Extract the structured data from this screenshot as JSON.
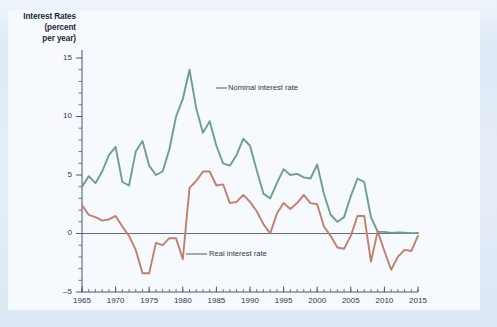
{
  "figure": {
    "background_color": "#e3ecf7",
    "panel_color": "#f6f9fd"
  },
  "axis_title": {
    "line1": "Interest Rates",
    "line2": "(percent",
    "line3": "per year)"
  },
  "annotations": {
    "nominal": "Nominal interest rate",
    "real": "Real interest rate"
  },
  "colors": {
    "nominal": "#6f9f88",
    "real": "#c0806a",
    "axis": "#4a5a68",
    "zero_line": "#6b6f75",
    "text": "#2b3a48"
  },
  "chart_data": {
    "type": "line",
    "title": "Interest Rates (percent per year)",
    "xlabel": "",
    "ylabel": "Interest Rates (percent per year)",
    "xlim": [
      1965,
      2015
    ],
    "ylim": [
      -5,
      15
    ],
    "yticks": [
      -5,
      0,
      5,
      10,
      15
    ],
    "xticks": [
      1965,
      1970,
      1975,
      1980,
      1985,
      1990,
      1995,
      2000,
      2005,
      2010,
      2015
    ],
    "minor_tick_step": 1,
    "grid": false,
    "legend_position": "inline-annotation",
    "zero_line": 0,
    "x": [
      1965,
      1966,
      1967,
      1968,
      1969,
      1970,
      1971,
      1972,
      1973,
      1974,
      1975,
      1976,
      1977,
      1978,
      1979,
      1980,
      1981,
      1982,
      1983,
      1984,
      1985,
      1986,
      1987,
      1988,
      1989,
      1990,
      1991,
      1992,
      1993,
      1994,
      1995,
      1996,
      1997,
      1998,
      1999,
      2000,
      2001,
      2002,
      2003,
      2004,
      2005,
      2006,
      2007,
      2008,
      2009,
      2010,
      2011,
      2012,
      2013,
      2014,
      2015
    ],
    "series": [
      {
        "name": "Nominal interest rate",
        "color": "#6f9f88",
        "values": [
          4.0,
          4.9,
          4.3,
          5.3,
          6.7,
          7.4,
          4.4,
          4.1,
          7.0,
          7.9,
          5.8,
          5.0,
          5.3,
          7.2,
          10.0,
          11.5,
          14.0,
          10.7,
          8.6,
          9.6,
          7.5,
          6.0,
          5.8,
          6.7,
          8.1,
          7.5,
          5.4,
          3.4,
          3.0,
          4.3,
          5.5,
          5.0,
          5.1,
          4.8,
          4.7,
          5.9,
          3.4,
          1.6,
          1.0,
          1.4,
          3.2,
          4.7,
          4.4,
          1.4,
          0.15,
          0.14,
          0.05,
          0.09,
          0.06,
          0.03,
          0.05
        ]
      },
      {
        "name": "Real interest rate",
        "color": "#c0806a",
        "values": [
          2.4,
          1.6,
          1.4,
          1.1,
          1.2,
          1.5,
          0.6,
          -0.2,
          -1.4,
          -3.4,
          -3.4,
          -0.8,
          -1.0,
          -0.4,
          -0.4,
          -2.2,
          3.9,
          4.5,
          5.3,
          5.3,
          4.1,
          4.2,
          2.6,
          2.7,
          3.3,
          2.7,
          1.9,
          0.8,
          0.0,
          1.7,
          2.6,
          2.1,
          2.6,
          3.3,
          2.6,
          2.5,
          0.6,
          -0.2,
          -1.2,
          -1.3,
          -0.2,
          1.5,
          1.5,
          -2.4,
          0.2,
          -1.5,
          -3.1,
          -2.0,
          -1.4,
          -1.5,
          -0.2
        ]
      }
    ]
  }
}
